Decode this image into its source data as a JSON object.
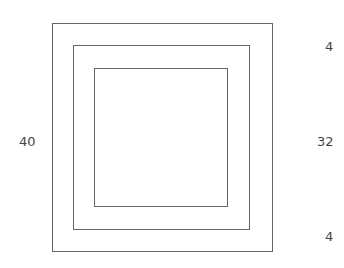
{
  "diagram": {
    "line_color": "#666666",
    "text_color": "#444444",
    "squares": [
      {
        "name": "outer",
        "left": 52,
        "top": 23,
        "right": 272,
        "bottom": 251
      },
      {
        "name": "middle",
        "left": 73,
        "top": 45,
        "right": 249,
        "bottom": 229
      },
      {
        "name": "inner",
        "left": 94,
        "top": 69,
        "right": 227,
        "bottom": 206
      }
    ],
    "labels": {
      "left_total": "40",
      "right_top": "4",
      "right_middle": "32",
      "right_bottom": "4"
    }
  }
}
